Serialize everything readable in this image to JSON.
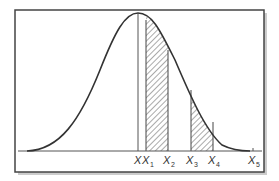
{
  "diagram": {
    "type": "normal-distribution-curve",
    "frame": {
      "color": "#444444",
      "shadow": "#bbbbbb"
    },
    "curve_color": "#333333",
    "hatch_color": "#555555",
    "mean_label": "X",
    "labels": [
      {
        "id": "x1",
        "base": "X",
        "sub": "1"
      },
      {
        "id": "x2",
        "base": "X",
        "sub": "2"
      },
      {
        "id": "x3",
        "base": "X",
        "sub": "3"
      },
      {
        "id": "x4",
        "base": "X",
        "sub": "4"
      },
      {
        "id": "x5",
        "base": "X",
        "sub": "5"
      }
    ],
    "shaded_regions": [
      {
        "from": "X1",
        "to": "X2"
      },
      {
        "from": "X3",
        "to": "X4"
      }
    ]
  }
}
